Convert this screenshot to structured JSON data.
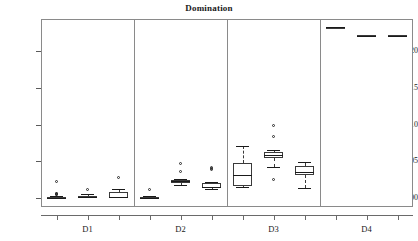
{
  "chart_data": {
    "type": "box",
    "title": "Domination",
    "xlabel": "",
    "ylabel": "",
    "ylim": [
      -0.012,
      0.2435
    ],
    "grid": false,
    "legend": null,
    "y_ticks": [
      0.0,
      0.05,
      0.1,
      0.15,
      0.2
    ],
    "y_tick_labels": [
      "0.00",
      "0.05",
      "0.10",
      "0.15",
      "0.20"
    ],
    "panels": [
      "D1",
      "D2",
      "D3",
      "D4"
    ],
    "boxes_per_panel": 3,
    "boxes": [
      {
        "panel": "D1",
        "index": 0,
        "whisker_low": 0.0,
        "q1": 0.0,
        "median": 0.0006,
        "q3": 0.0015,
        "whisker_high": 0.003,
        "outliers": [
          0.0225,
          0.006,
          0.0052,
          0.0046,
          0.004
        ]
      },
      {
        "panel": "D1",
        "index": 1,
        "whisker_low": 0.0,
        "q1": 0.0,
        "median": 0.001,
        "q3": 0.0035,
        "whisker_high": 0.005,
        "outliers": [
          0.0112
        ]
      },
      {
        "panel": "D1",
        "index": 2,
        "whisker_low": 0.0,
        "q1": 0.0,
        "median": 0.0012,
        "q3": 0.009,
        "whisker_high": 0.0122,
        "outliers": [
          0.0272
        ]
      },
      {
        "panel": "D2",
        "index": 0,
        "whisker_low": 0.0,
        "q1": 0.0,
        "median": 0.0008,
        "q3": 0.0022,
        "whisker_high": 0.0032,
        "outliers": [
          0.0105
        ]
      },
      {
        "panel": "D2",
        "index": 1,
        "whisker_low": 0.0185,
        "q1": 0.021,
        "median": 0.0233,
        "q3": 0.025,
        "whisker_high": 0.0262,
        "outliers": [
          0.047,
          0.0352
        ]
      },
      {
        "panel": "D2",
        "index": 2,
        "whisker_low": 0.0118,
        "q1": 0.014,
        "median": 0.0155,
        "q3": 0.0208,
        "whisker_high": 0.0215,
        "outliers": [
          0.0412,
          0.0392,
          0.0378
        ]
      },
      {
        "panel": "D3",
        "index": 0,
        "whisker_low": 0.0148,
        "q1": 0.0172,
        "median": 0.032,
        "q3": 0.0472,
        "whisker_high": 0.071,
        "outliers": []
      },
      {
        "panel": "D3",
        "index": 1,
        "whisker_low": 0.0418,
        "q1": 0.0548,
        "median": 0.0592,
        "q3": 0.0632,
        "whisker_high": 0.0655,
        "outliers": [
          0.0982,
          0.0832,
          0.0252
        ]
      },
      {
        "panel": "D3",
        "index": 2,
        "whisker_low": 0.014,
        "q1": 0.0318,
        "median": 0.0352,
        "q3": 0.0432,
        "whisker_high": 0.049,
        "outliers": []
      },
      {
        "panel": "D4",
        "index": 0,
        "whisker_low": 0.232,
        "q1": 0.232,
        "median": 0.2322,
        "q3": 0.2325,
        "whisker_high": 0.2325,
        "outliers": []
      },
      {
        "panel": "D4",
        "index": 1,
        "whisker_low": 0.2208,
        "q1": 0.2208,
        "median": 0.221,
        "q3": 0.2212,
        "whisker_high": 0.2212,
        "outliers": []
      },
      {
        "panel": "D4",
        "index": 2,
        "whisker_low": 0.2208,
        "q1": 0.2208,
        "median": 0.221,
        "q3": 0.2212,
        "whisker_high": 0.2212,
        "outliers": []
      }
    ]
  },
  "colors": {
    "frame": "#8a8a8a",
    "box_stroke": "#3a3a3a",
    "median": "#1a1a1a",
    "background": "#ffffff",
    "text": "#1a1a1a"
  }
}
